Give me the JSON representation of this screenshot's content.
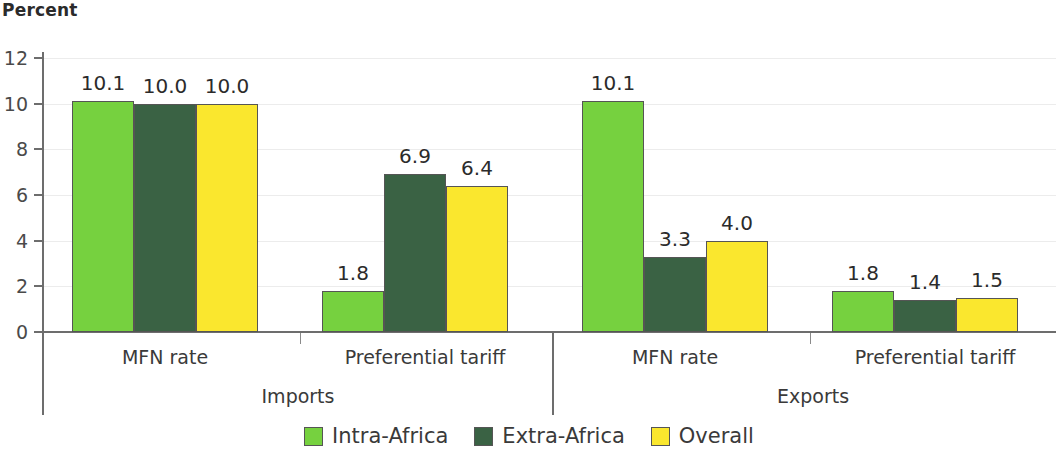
{
  "chart_data": {
    "type": "bar",
    "title": "Percent",
    "xlabel": "",
    "ylabel": "Percent",
    "ylim": [
      0,
      12
    ],
    "ytick_labels": [
      "12",
      "10",
      "8",
      "6",
      "4",
      "2",
      "0"
    ],
    "ytick_values": [
      12,
      10,
      8,
      6,
      4,
      2,
      0
    ],
    "grid": true,
    "legend_position": "bottom",
    "categories": [
      "MFN rate",
      "Preferential tariff",
      "MFN rate",
      "Preferential tariff"
    ],
    "group_labels": [
      "Imports",
      "Exports"
    ],
    "series": [
      {
        "name": "Intra-Africa",
        "color": "#76d13f",
        "values": [
          10.1,
          1.8,
          10.1,
          1.8
        ]
      },
      {
        "name": "Extra-Africa",
        "color": "#3a6244",
        "values": [
          10.0,
          6.9,
          3.3,
          1.4
        ]
      },
      {
        "name": "Overall",
        "color": "#fae72e",
        "values": [
          10.0,
          6.4,
          4.0,
          1.5
        ]
      }
    ],
    "data_labels": [
      [
        "10.1",
        "10.0",
        "10.0"
      ],
      [
        "1.8",
        "6.9",
        "6.4"
      ],
      [
        "10.1",
        "3.3",
        "4.0"
      ],
      [
        "1.8",
        "1.4",
        "1.5"
      ]
    ]
  },
  "legend": {
    "items": [
      {
        "label": "Intra-Africa",
        "color": "#76d13f"
      },
      {
        "label": "Extra-Africa",
        "color": "#3a6244"
      },
      {
        "label": "Overall",
        "color": "#fae72e"
      }
    ]
  }
}
